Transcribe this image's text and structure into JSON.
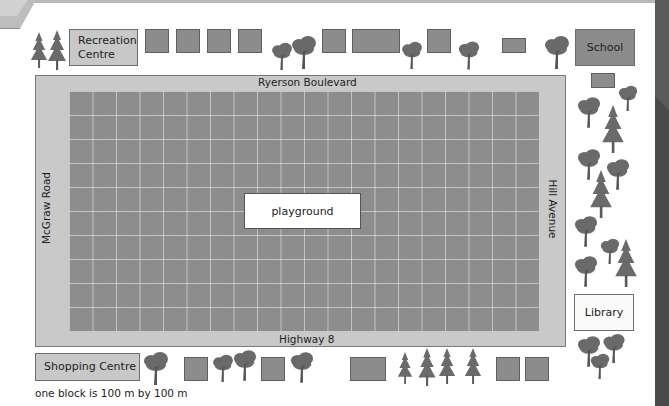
{
  "map": {
    "title": "Neighbourhood map",
    "buildings": {
      "recreation_centre": "Recreation Centre",
      "school": "School",
      "library": "Library",
      "shopping_centre": "Shopping Centre"
    },
    "roads": {
      "north": "Ryerson Boulevard",
      "south": "Highway 8",
      "west": "McGraw Road",
      "east": "Hill Avenue"
    },
    "park": {
      "label": "playground",
      "grid_columns": 20,
      "grid_rows": 10
    },
    "scale_note": "one block is 100 m by 100 m",
    "colors": {
      "block_fill": "#8c8c8c",
      "road_fill": "#c9c9c9",
      "grid_fill": "#8d8d8d",
      "tree_fill": "#6a6a6a",
      "label_fill": "#c8c8c8"
    }
  }
}
